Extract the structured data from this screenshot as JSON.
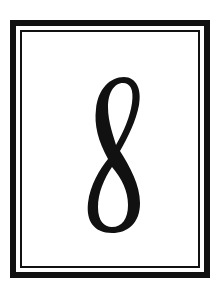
{
  "card": {
    "numeral": "8",
    "border_color": "#111111",
    "background": "#ffffff"
  }
}
